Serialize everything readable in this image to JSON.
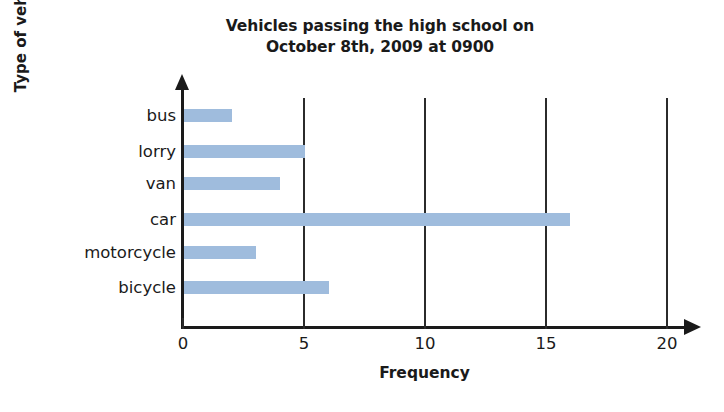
{
  "chart_data": {
    "type": "bar",
    "orientation": "horizontal",
    "title": "Vehicles passing the high school on October 8th, 2009 at 0900",
    "title_lines": [
      "Vehicles passing the high school on",
      "October 8th, 2009 at 0900"
    ],
    "categories": [
      "bus",
      "lorry",
      "van",
      "car",
      "motorcycle",
      "bicycle"
    ],
    "values": [
      2,
      5,
      4,
      16,
      3,
      6
    ],
    "xlabel": "Frequency",
    "ylabel": "Type of vehicle",
    "xlim": [
      0,
      20
    ],
    "xticks": [
      0,
      5,
      10,
      15,
      20
    ],
    "xtick_labels": [
      "0",
      "5",
      "10",
      "15",
      "20"
    ],
    "grid": "vertical-only",
    "legend": null,
    "bar_color": "#9fbcdd",
    "axis_color": "#1a1a1a"
  }
}
